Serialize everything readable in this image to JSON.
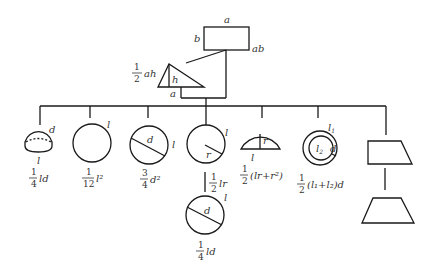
{
  "diagram": {
    "title": "",
    "rectangle": {
      "top_label": "a",
      "left_label": "b",
      "area": "ab"
    },
    "triangle": {
      "height_label": "h",
      "base_label": "a",
      "area_coef": {
        "num": "1",
        "den": "2"
      },
      "area_expr": "ah"
    },
    "shapes": [
      {
        "id": "hemisphere-cap",
        "labels": {
          "side": "d",
          "bottom": "l"
        },
        "formula": {
          "num": "1",
          "den": "4",
          "expr": "ld"
        }
      },
      {
        "id": "circle-circumference",
        "labels": {
          "side": "l"
        },
        "formula": {
          "num": "1",
          "den": "12",
          "expr": "l²"
        }
      },
      {
        "id": "circle-diameter",
        "labels": {
          "inner": "d",
          "side": "l"
        },
        "formula": {
          "num": "3",
          "den": "4",
          "expr": "d²"
        }
      },
      {
        "id": "circle-radius",
        "labels": {
          "inner": "r",
          "side": "l"
        },
        "formula": {
          "num": "1",
          "den": "2",
          "expr": "lr"
        }
      },
      {
        "id": "circle-segment",
        "labels": {
          "inner": "r",
          "bottom": "l"
        },
        "formula": {
          "num": "1",
          "den": "2",
          "expr": "(lr+r²)"
        }
      },
      {
        "id": "annulus",
        "labels": {
          "outer": "l1",
          "inner": "l2",
          "width": "d"
        },
        "formula": {
          "num": "1",
          "den": "2",
          "expr": "(l₁+l₂)d"
        }
      },
      {
        "id": "trapezoid-pair",
        "labels": {},
        "formula": null
      }
    ],
    "child_circle": {
      "labels": {
        "inner": "d",
        "side": "l"
      },
      "formula": {
        "num": "1",
        "den": "4",
        "expr": "ld"
      }
    }
  }
}
